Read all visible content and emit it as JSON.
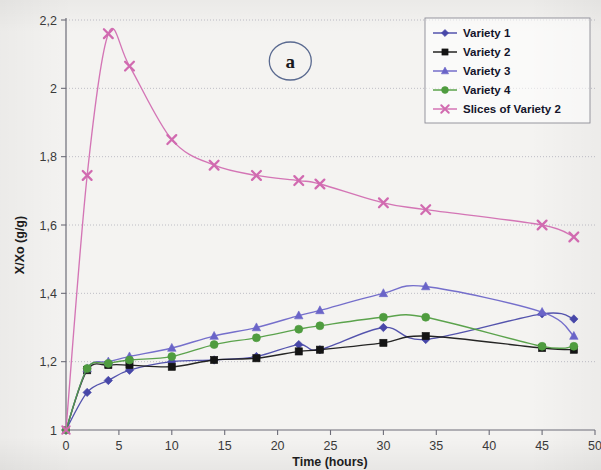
{
  "figure": {
    "panel_label": "a",
    "background_color": "#f4f3f1"
  },
  "chart_data": {
    "type": "line",
    "title": "",
    "subtitle": "",
    "xlabel": "Time (hours)",
    "ylabel": "X/Xo (g/g)",
    "xlim": [
      0,
      50
    ],
    "ylim": [
      1,
      2.2
    ],
    "xticks": [
      0,
      5,
      10,
      15,
      20,
      25,
      30,
      35,
      40,
      45,
      50
    ],
    "xtick_labels": [
      "0",
      "5",
      "10",
      "15",
      "20",
      "25",
      "30",
      "35",
      "40",
      "45",
      "50"
    ],
    "yticks": [
      1,
      1.2,
      1.4,
      1.6,
      1.8,
      2,
      2.2
    ],
    "ytick_labels": [
      "1",
      "1,2",
      "1,4",
      "1,6",
      "1,8",
      "2",
      "2,2"
    ],
    "grid": "horizontal",
    "grid_color": "#9a9aa8",
    "legend_position": "top-right",
    "annotations": [
      {
        "text": "a",
        "x": 21.2,
        "y": 2.08,
        "shape": "ellipse"
      }
    ],
    "series": [
      {
        "name": "Variety 1",
        "color": "#4747a8",
        "marker": "diamond",
        "x": [
          0,
          2,
          4,
          6,
          10,
          14,
          18,
          22,
          24,
          30,
          34,
          45,
          48
        ],
        "y": [
          1.0,
          1.11,
          1.145,
          1.175,
          1.2,
          1.205,
          1.215,
          1.25,
          1.235,
          1.3,
          1.265,
          1.34,
          1.325
        ]
      },
      {
        "name": "Variety 2",
        "color": "#141414",
        "marker": "square",
        "x": [
          0,
          2,
          4,
          6,
          10,
          14,
          18,
          22,
          24,
          30,
          34,
          45,
          48
        ],
        "y": [
          1.0,
          1.175,
          1.19,
          1.19,
          1.185,
          1.205,
          1.21,
          1.23,
          1.235,
          1.255,
          1.275,
          1.24,
          1.235
        ]
      },
      {
        "name": "Variety 3",
        "color": "#6a64c8",
        "marker": "triangle",
        "x": [
          0,
          2,
          4,
          6,
          10,
          14,
          18,
          22,
          24,
          30,
          34,
          45,
          48
        ],
        "y": [
          1.0,
          1.18,
          1.2,
          1.215,
          1.24,
          1.275,
          1.3,
          1.335,
          1.35,
          1.4,
          1.42,
          1.345,
          1.275
        ]
      },
      {
        "name": "Variety 4",
        "color": "#4f9c3f",
        "marker": "circle",
        "x": [
          0,
          2,
          4,
          6,
          10,
          14,
          18,
          22,
          24,
          30,
          34,
          45,
          48
        ],
        "y": [
          1.0,
          1.18,
          1.195,
          1.205,
          1.215,
          1.25,
          1.27,
          1.295,
          1.305,
          1.33,
          1.33,
          1.245,
          1.245
        ]
      },
      {
        "name": "Slices of Variety 2",
        "color": "#d16ab0",
        "marker": "x",
        "x": [
          0,
          2,
          4,
          6,
          10,
          14,
          18,
          22,
          24,
          30,
          34,
          45,
          48
        ],
        "y": [
          1.0,
          1.745,
          2.16,
          2.065,
          1.85,
          1.775,
          1.745,
          1.73,
          1.72,
          1.665,
          1.645,
          1.6,
          1.565
        ]
      }
    ]
  },
  "legend": {
    "items": [
      {
        "label": "Variety 1",
        "color": "#4747a8",
        "marker": "diamond"
      },
      {
        "label": "Variety 2",
        "color": "#141414",
        "marker": "square"
      },
      {
        "label": "Variety 3",
        "color": "#6a64c8",
        "marker": "triangle"
      },
      {
        "label": "Variety 4",
        "color": "#4f9c3f",
        "marker": "circle"
      },
      {
        "label": "Slices of Variety 2",
        "color": "#d16ab0",
        "marker": "x"
      }
    ]
  }
}
